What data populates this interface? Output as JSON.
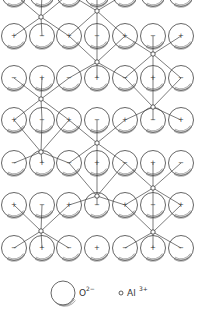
{
  "figure": {
    "columns_x": [
      14,
      42,
      69,
      97,
      125,
      153,
      181
    ],
    "ion_radius": 12.5,
    "rows": [
      {
        "y": -6,
        "signs": [
          "",
          "",
          "",
          "",
          "",
          "",
          ""
        ]
      },
      {
        "y": 36,
        "signs": [
          "+",
          "−",
          "+",
          "−",
          "+",
          "−",
          "+"
        ]
      },
      {
        "y": 78,
        "signs": [
          "−",
          "+",
          "−",
          "+",
          "−",
          "+",
          "−"
        ]
      },
      {
        "y": 120,
        "signs": [
          "+",
          "−",
          "+",
          "−",
          "+",
          "−",
          "+"
        ]
      },
      {
        "y": 163,
        "signs": [
          "−",
          "+",
          "−",
          "+",
          "−",
          "+",
          "−"
        ]
      },
      {
        "y": 205,
        "signs": [
          "+",
          "−",
          "+",
          "−",
          "+",
          "−",
          "+"
        ]
      },
      {
        "y": 248,
        "signs": [
          "−",
          "+",
          "−",
          "+",
          "−",
          "+",
          "−"
        ]
      }
    ],
    "al_sites": [
      {
        "x": 41,
        "y": 17
      },
      {
        "x": 97,
        "y": 11
      },
      {
        "x": 97,
        "y": 62
      },
      {
        "x": 153,
        "y": 54
      },
      {
        "x": 41,
        "y": 99
      },
      {
        "x": 153,
        "y": 107
      },
      {
        "x": 41,
        "y": 152
      },
      {
        "x": 97,
        "y": 143
      },
      {
        "x": 97,
        "y": 196
      },
      {
        "x": 153,
        "y": 188
      },
      {
        "x": 41,
        "y": 231
      },
      {
        "x": 153,
        "y": 232
      }
    ]
  },
  "legend": {
    "oxygen_label": "O",
    "oxygen_charge": "2−",
    "aluminum_label": "Al",
    "aluminum_charge": "3+"
  },
  "colors": {
    "stroke": "#444444",
    "background": "#ffffff"
  }
}
